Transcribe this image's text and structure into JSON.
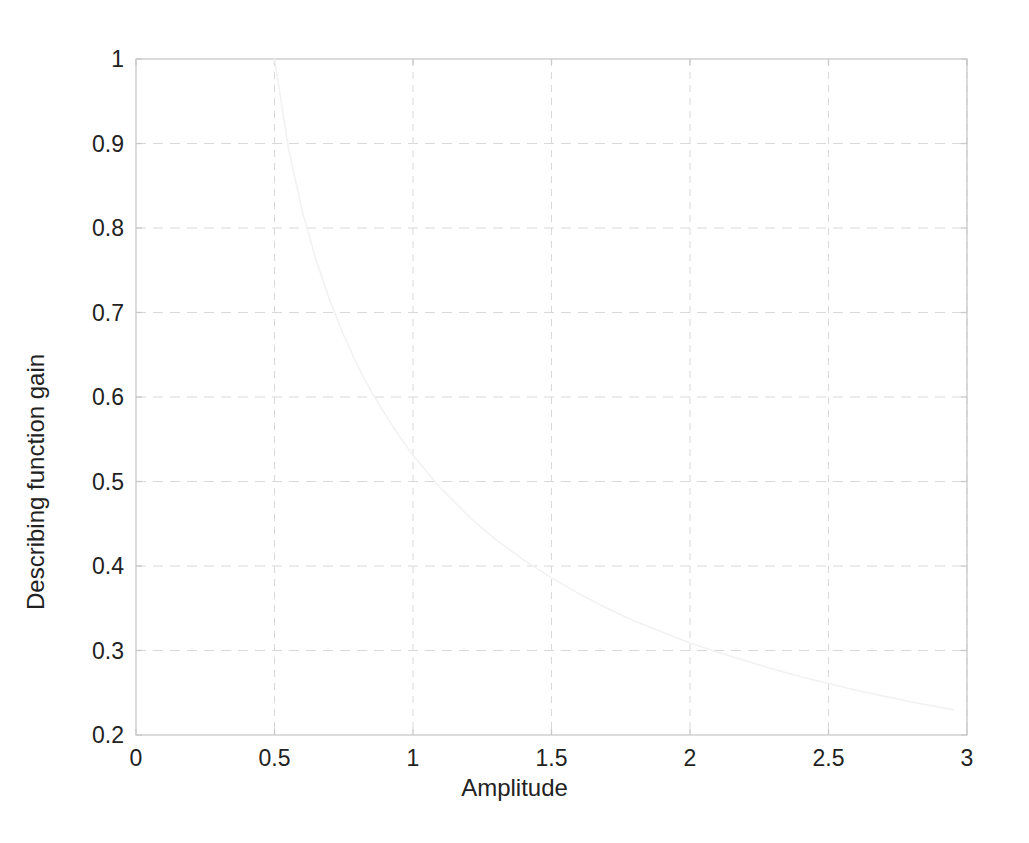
{
  "chart_data": {
    "type": "line",
    "title": "",
    "xlabel": "Amplitude",
    "ylabel": "Describing function gain",
    "xlim": [
      0,
      3
    ],
    "ylim": [
      0.2,
      1
    ],
    "xticks": [
      0,
      0.5,
      1,
      1.5,
      2,
      2.5,
      3
    ],
    "xtick_labels": [
      "0",
      "0.5",
      "1",
      "1.5",
      "2",
      "2.5",
      "3"
    ],
    "yticks": [
      0.2,
      0.3,
      0.4,
      0.5,
      0.6,
      0.7,
      0.8,
      0.9,
      1
    ],
    "ytick_labels": [
      "0.2",
      "0.3",
      "0.4",
      "0.5",
      "0.6",
      "0.7",
      "0.8",
      "0.9",
      "1"
    ],
    "grid": true,
    "grid_style": "dashed",
    "legend": null,
    "series": [
      {
        "name": "Describing function gain",
        "color": "#f2f2f2",
        "line_width": 1.6,
        "x": [
          0.5,
          0.55,
          0.6,
          0.65,
          0.7,
          0.75,
          0.8,
          0.85,
          0.9,
          0.95,
          1.0,
          1.1,
          1.2,
          1.3,
          1.4,
          1.5,
          1.6,
          1.7,
          1.8,
          1.9,
          2.0,
          2.1,
          2.2,
          2.3,
          2.4,
          2.5,
          2.6,
          2.7,
          2.8,
          2.9,
          2.95
        ],
        "y": [
          1.0,
          0.895,
          0.82,
          0.762,
          0.714,
          0.673,
          0.637,
          0.606,
          0.579,
          0.554,
          0.531,
          0.492,
          0.459,
          0.431,
          0.407,
          0.386,
          0.367,
          0.35,
          0.335,
          0.322,
          0.309,
          0.298,
          0.288,
          0.278,
          0.269,
          0.261,
          0.253,
          0.246,
          0.239,
          0.233,
          0.23
        ]
      }
    ]
  },
  "axes": {
    "frame_color": "#c9c9c9",
    "grid_color": "#d9d9d9",
    "tick_text_color": "#222222",
    "background": "#ffffff"
  }
}
